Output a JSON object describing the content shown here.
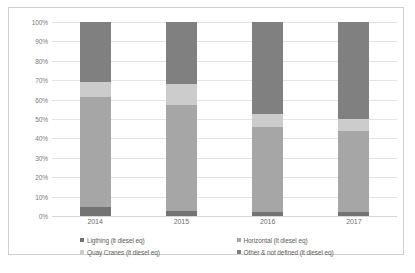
{
  "chart_data": {
    "type": "bar",
    "subtype": "100% stacked column",
    "title": "",
    "xlabel": "",
    "ylabel": "",
    "categories": [
      "2014",
      "2015",
      "2016",
      "2017"
    ],
    "ylim": [
      0,
      100
    ],
    "ytick_labels": [
      "0%",
      "10%",
      "20%",
      "30%",
      "40%",
      "50%",
      "60%",
      "70%",
      "80%",
      "90%",
      "100%"
    ],
    "ytick_values": [
      0,
      10,
      20,
      30,
      40,
      50,
      60,
      70,
      80,
      90,
      100
    ],
    "grid": true,
    "legend_position": "bottom",
    "stack_order_bottom_to_top": [
      "Ligthing (lt diesel eq)",
      "Horizontal (lt diesel eq)",
      "Quay Cranes (lt diesel eq)",
      "Other & not defined (lt diesel eq)"
    ],
    "series": [
      {
        "name": "Ligthing (lt diesel eq)",
        "color": "#737373",
        "values": [
          4.8,
          2.7,
          2.1,
          2.1
        ]
      },
      {
        "name": "Horizontal (lt diesel eq)",
        "color": "#a6a6a6",
        "values": [
          56.7,
          54.3,
          43.9,
          41.9
        ]
      },
      {
        "name": "Quay Cranes (lt diesel eq)",
        "color": "#cccccc",
        "values": [
          7.8,
          11.0,
          6.4,
          6.0
        ]
      },
      {
        "name": "Other & not defined (lt diesel eq)",
        "color": "#808080",
        "values": [
          30.7,
          32.0,
          47.6,
          50.0
        ]
      }
    ]
  },
  "legend": {
    "items": [
      {
        "label": "Ligthing (lt diesel eq)",
        "color": "#737373"
      },
      {
        "label": "Horizontal (lt diesel eq)",
        "color": "#a6a6a6"
      },
      {
        "label": "Quay Cranes (lt diesel eq)",
        "color": "#cccccc"
      },
      {
        "label": "Other & not defined (lt diesel eq)",
        "color": "#808080"
      }
    ]
  },
  "caption": {
    "text": ""
  }
}
